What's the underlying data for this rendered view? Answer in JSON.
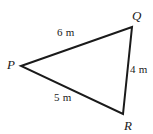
{
  "figure": {
    "type": "triangle-diagram",
    "background_color": "#ffffff",
    "stroke_color": "#1a1a1a",
    "stroke_width": 2,
    "vertices": [
      {
        "name": "P",
        "label": "P",
        "x": 21,
        "y": 66
      },
      {
        "name": "Q",
        "label": "Q",
        "x": 132,
        "y": 27
      },
      {
        "name": "R",
        "label": "R",
        "x": 123,
        "y": 114
      }
    ],
    "sides": [
      {
        "name": "PQ",
        "label": "6 m",
        "value": 6,
        "unit": "m",
        "from": "P",
        "to": "Q"
      },
      {
        "name": "QR",
        "label": "4 m",
        "value": 4,
        "unit": "m",
        "from": "Q",
        "to": "R"
      },
      {
        "name": "PR",
        "label": "5 m",
        "value": 5,
        "unit": "m",
        "from": "P",
        "to": "R"
      }
    ]
  }
}
